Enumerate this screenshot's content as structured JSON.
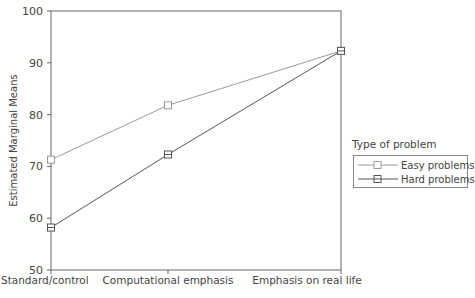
{
  "chart_data": {
    "type": "line",
    "title": "",
    "xlabel": "",
    "ylabel": "Estimated Marginal Means",
    "ylim": [
      50,
      100
    ],
    "yticks": [
      50,
      60,
      70,
      80,
      90,
      100
    ],
    "grid": false,
    "categories": [
      "Standard/control",
      "Computational emphasis",
      "Emphasis on real life"
    ],
    "series": [
      {
        "name": "Easy problems",
        "values": [
          71.3,
          81.8,
          92.3
        ],
        "color": "#9a9a9a",
        "marker": "square"
      },
      {
        "name": "Hard problems",
        "values": [
          58.2,
          72.3,
          92.3
        ],
        "color": "#555555",
        "marker": "square"
      }
    ],
    "legend": {
      "title": "Type of problem",
      "position": "right"
    }
  },
  "legend": {
    "title": "Type of problem",
    "items": [
      "Easy problems",
      "Hard problems"
    ]
  }
}
